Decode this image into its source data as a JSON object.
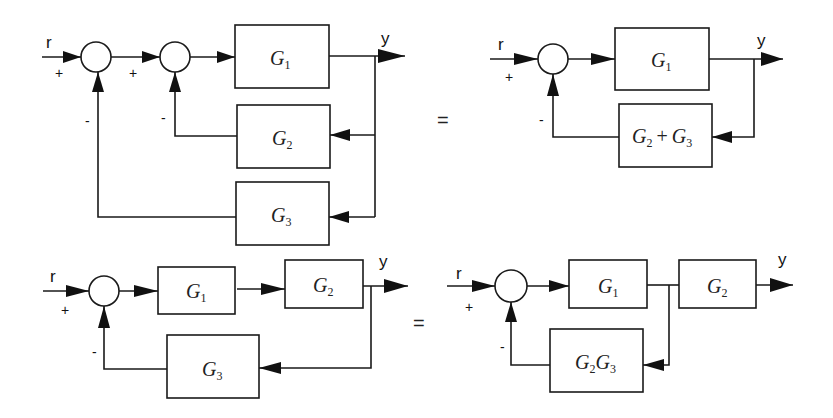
{
  "diagrams": [
    {
      "id": "top-left",
      "input_label": "r",
      "output_label": "y",
      "signs": {
        "sum1_input": "+",
        "sum1_feedback": "-",
        "sum2_input": "+",
        "sum2_feedback": "-"
      },
      "blocks": [
        {
          "name": "G",
          "sub": "1"
        },
        {
          "name": "G",
          "sub": "2"
        },
        {
          "name": "G",
          "sub": "3"
        }
      ]
    },
    {
      "id": "top-right",
      "input_label": "r",
      "output_label": "y",
      "signs": {
        "sum_input": "+",
        "sum_feedback": "-"
      },
      "blocks": [
        {
          "name": "G",
          "sub": "1"
        },
        {
          "name1": "G",
          "sub1": "2",
          "op": "+",
          "name2": "G",
          "sub2": "3"
        }
      ]
    },
    {
      "id": "bottom-left",
      "input_label": "r",
      "output_label": "y",
      "signs": {
        "sum_input": "+",
        "sum_feedback": "-"
      },
      "blocks": [
        {
          "name": "G",
          "sub": "1"
        },
        {
          "name": "G",
          "sub": "2"
        },
        {
          "name": "G",
          "sub": "3"
        }
      ]
    },
    {
      "id": "bottom-right",
      "input_label": "r",
      "output_label": "y",
      "signs": {
        "sum_input": "+",
        "sum_feedback": "-"
      },
      "blocks": [
        {
          "name": "G",
          "sub": "1"
        },
        {
          "name": "G",
          "sub": "2"
        },
        {
          "name1": "G",
          "sub1": "2",
          "name2": "G",
          "sub2": "3"
        }
      ]
    }
  ],
  "equals": [
    "=",
    "="
  ]
}
